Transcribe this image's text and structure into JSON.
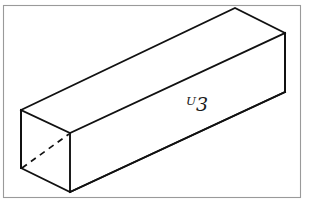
{
  "figure": {
    "kind": "line-drawing",
    "label": "ᵁ3",
    "label_plain": "T",
    "background_color": "#ffffff",
    "line_color": "#111111",
    "frame_color": "#9a9a9a"
  },
  "canvas": {
    "width": 309,
    "height": 203
  },
  "frame": {
    "x": 3.5,
    "y": 5.5,
    "width": 297,
    "height": 192
  },
  "geometry": {
    "vertices": {
      "left_top_back": [
        21,
        110
      ],
      "left_top_front": [
        70,
        133
      ],
      "left_bottom_back": [
        21,
        168
      ],
      "left_bottom_front": [
        70,
        192
      ],
      "right_top_back": [
        235,
        8
      ],
      "right_top_front": [
        285,
        33
      ],
      "right_bottom_front": [
        285,
        92
      ],
      "right_bottom_back": [
        213,
        126
      ]
    },
    "faces": {
      "top": [
        [
          21,
          110
        ],
        [
          235,
          8
        ],
        [
          285,
          33
        ],
        [
          70,
          133
        ]
      ],
      "front_long": [
        [
          70,
          133
        ],
        [
          285,
          33
        ],
        [
          285,
          92
        ],
        [
          70,
          192
        ]
      ],
      "left_end": [
        [
          21,
          110
        ],
        [
          70,
          133
        ],
        [
          70,
          192
        ],
        [
          21,
          168
        ]
      ]
    },
    "hidden_edges": [
      {
        "from": [
          21,
          168
        ],
        "to": [
          70,
          133
        ]
      }
    ]
  },
  "label_position": {
    "x": 197,
    "y": 111
  }
}
